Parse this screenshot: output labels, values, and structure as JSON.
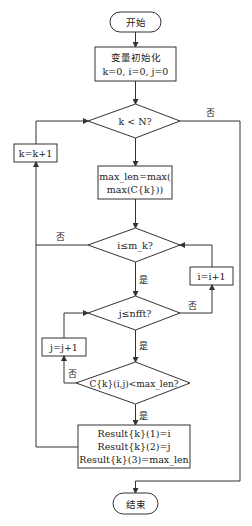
{
  "flowchart": {
    "start": {
      "label": "开始"
    },
    "init": {
      "line1": "变量初始化",
      "line2": "k=0, i=0, j=0"
    },
    "cond_k": {
      "label": "k < N?"
    },
    "inc_k": {
      "label": "k=k+1"
    },
    "max_len": {
      "line1": "max_len=max(",
      "line2": "max(C{k}))"
    },
    "cond_i": {
      "label": "i≤m_k?"
    },
    "inc_i": {
      "label": "i=i+1"
    },
    "cond_j": {
      "label": "j≤nfft?"
    },
    "inc_j": {
      "label": "j=j+1"
    },
    "cond_c": {
      "label": "C{k}(i,j)<max_len?"
    },
    "result": {
      "line1": "Result{k}(1)=i",
      "line2": "Result{k}(2)=j",
      "line3": "Result{k}(3)=max_len"
    },
    "end": {
      "label": "结束"
    },
    "edge_labels": {
      "yes": "是",
      "no": "否"
    }
  }
}
